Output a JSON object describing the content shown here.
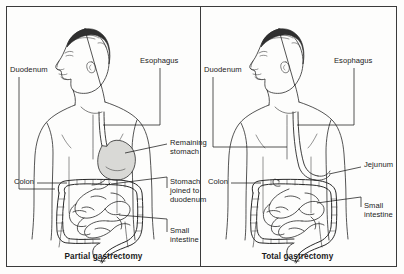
{
  "figure": {
    "background_color": "#fdfdfc",
    "border_color": "#3b3b3b",
    "ink_color": "#1b1b1b",
    "organ_fill_color": "#d9d9d6"
  },
  "panels": [
    {
      "id": "partial-gastrectomy",
      "caption": "Partial gastrectomy",
      "labels": [
        {
          "name": "duodenum",
          "text": "Duodenum",
          "x": 3,
          "y": 58
        },
        {
          "name": "esophagus",
          "text": "Esophagus",
          "x": 133,
          "y": 49
        },
        {
          "name": "colon",
          "text": "Colon",
          "x": 7,
          "y": 170
        },
        {
          "name": "remaining-stomach",
          "text": "Remaining\nstomach",
          "x": 163,
          "y": 131
        },
        {
          "name": "stomach-joined-duodenum",
          "text": "Stomach\njoined to\nduodenum",
          "x": 163,
          "y": 170
        },
        {
          "name": "small-intestine",
          "text": "Small\nintestine",
          "x": 163,
          "y": 219
        }
      ]
    },
    {
      "id": "total-gastrectomy",
      "caption": "Total gastrectomy",
      "labels": [
        {
          "name": "duodenum",
          "text": "Duodenum",
          "x": 3,
          "y": 58
        },
        {
          "name": "esophagus",
          "text": "Esophagus",
          "x": 133,
          "y": 49
        },
        {
          "name": "colon",
          "text": "Colon",
          "x": 7,
          "y": 170
        },
        {
          "name": "jejunum",
          "text": "Jejunum",
          "x": 163,
          "y": 153
        },
        {
          "name": "small-intestine",
          "text": "Small\nintestine",
          "x": 163,
          "y": 194
        }
      ]
    }
  ]
}
